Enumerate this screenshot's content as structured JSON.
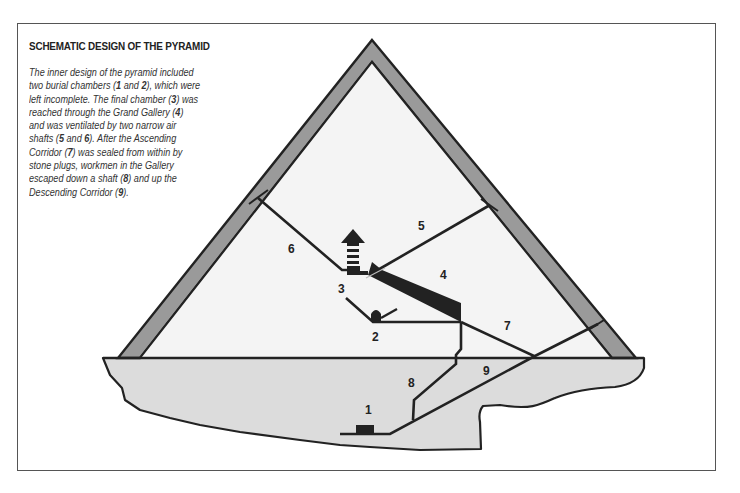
{
  "title": "SCHEMATIC DESIGN OF THE PYRAMID",
  "description": {
    "segments": [
      {
        "t": "The inner design of the pyramid included two burial chambers (",
        "b": false
      },
      {
        "t": "1",
        "b": true
      },
      {
        "t": " and ",
        "b": false
      },
      {
        "t": "2",
        "b": true
      },
      {
        "t": "), which were left incomplete. The final chamber (",
        "b": false
      },
      {
        "t": "3",
        "b": true
      },
      {
        "t": ") was reached through the Grand Gallery (",
        "b": false
      },
      {
        "t": "4",
        "b": true
      },
      {
        "t": ") and was ventilated by two narrow air shafts (",
        "b": false
      },
      {
        "t": "5",
        "b": true
      },
      {
        "t": " and ",
        "b": false
      },
      {
        "t": "6",
        "b": true
      },
      {
        "t": "). After the Ascending Corridor (",
        "b": false
      },
      {
        "t": "7",
        "b": true
      },
      {
        "t": ") was sealed from within by stone plugs, workmen in the Gallery escaped down a shaft (",
        "b": false
      },
      {
        "t": "8",
        "b": true
      },
      {
        "t": ") and up the Descending Corridor (",
        "b": false
      },
      {
        "t": "9",
        "b": true
      },
      {
        "t": ").",
        "b": false
      }
    ]
  },
  "labels": {
    "l1": "1",
    "l2": "2",
    "l3": "3",
    "l4": "4",
    "l5": "5",
    "l6": "6",
    "l7": "7",
    "l8": "8",
    "l9": "9"
  },
  "legend": {
    "1": "Subterranean burial chamber (incomplete)",
    "2": "Burial chamber (incomplete)",
    "3": "Final chamber",
    "4": "Grand Gallery",
    "5": "Air shaft",
    "6": "Air shaft",
    "7": "Ascending Corridor",
    "8": "Escape shaft",
    "9": "Descending Corridor"
  },
  "colors": {
    "casing": "#9a9a9a",
    "interior": "#f4f4f4",
    "bedrock": "#dcdcdc",
    "line": "#222222",
    "frame": "#555555"
  }
}
